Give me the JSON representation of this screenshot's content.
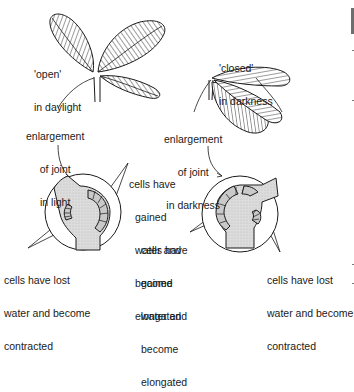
{
  "figure": {
    "left_panel": {
      "state_label": [
        "'open'",
        "in daylight"
      ],
      "joint_label": [
        "enlargement",
        "of joint",
        "in light"
      ],
      "gained_label": [
        "cells have",
        "gained",
        "water and",
        "become",
        "elongated"
      ],
      "lost_label": [
        "cells have lost",
        "water and become",
        "contracted"
      ]
    },
    "right_panel": {
      "state_label": [
        "'closed'",
        "in darkness"
      ],
      "joint_label": [
        "enlargement",
        "of joint",
        "in darkness"
      ],
      "gained_label": [
        "cells have",
        "gained",
        "water and",
        "become",
        "elongated"
      ],
      "lost_label": [
        "cells have lost",
        "water and become",
        "contracted"
      ]
    }
  },
  "colors": {
    "ink": "#1a1a1a",
    "stipple": "#d9d9d9",
    "background": "#ffffff"
  }
}
